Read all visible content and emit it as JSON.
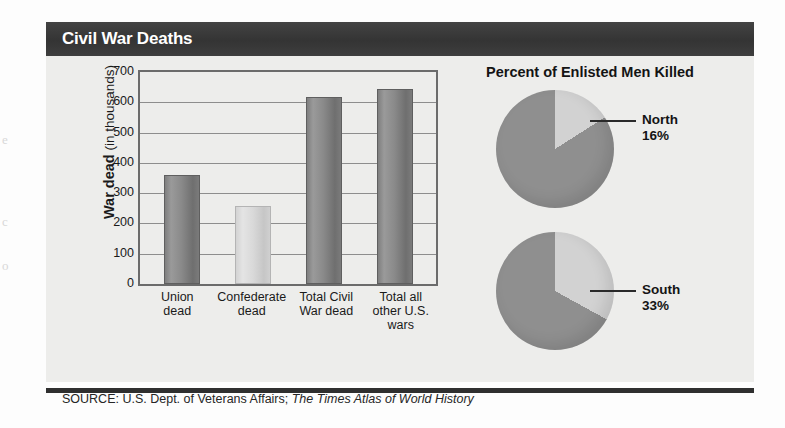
{
  "header": {
    "title": "Civil War Deaths",
    "bar_color": "#3a3a3a",
    "title_color": "#ffffff"
  },
  "panel": {
    "background": "#ededeb"
  },
  "source": {
    "prefix": "SOURCE: U.S. Dept. of Veterans Affairs; ",
    "italic": "The Times Atlas of World History"
  },
  "bleed_through": {
    "m1": "e",
    "m2": "c",
    "m3": "o"
  },
  "chart_data": [
    {
      "type": "bar",
      "title": "Civil War Deaths",
      "xlabel": "",
      "ylabel": "War dead (in thousands)",
      "ylabel_bold": "War dead",
      "ylabel_rest": " (in thousands)",
      "categories": [
        "Union dead",
        "Confederate dead",
        "Total Civil War dead",
        "Total all other U.S. wars"
      ],
      "category_lines": [
        [
          "Union",
          "dead"
        ],
        [
          "Confederate",
          "dead"
        ],
        [
          "Total Civil",
          "War dead"
        ],
        [
          "Total all",
          "other U.S.",
          "wars"
        ]
      ],
      "values": [
        360,
        258,
        618,
        643
      ],
      "bar_colors": [
        "#8a8a8a",
        "#d9d9d9",
        "#8a8a8a",
        "#8a8a8a"
      ],
      "ylim": [
        0,
        700
      ],
      "yticks": [
        700,
        600,
        500,
        400,
        300,
        200,
        100,
        0
      ],
      "grid": true,
      "units": "thousands"
    },
    {
      "type": "pie",
      "title": "Percent of Enlisted Men Killed",
      "charts": [
        {
          "name": "North",
          "label": "North",
          "percent_label": "16%",
          "values": [
            16,
            84
          ],
          "slice_names": [
            "killed",
            "survived"
          ],
          "slice_colors": [
            "#d2d2d2",
            "#8f8f8f"
          ]
        },
        {
          "name": "South",
          "label": "South",
          "percent_label": "33%",
          "values": [
            33,
            67
          ],
          "slice_names": [
            "killed",
            "survived"
          ],
          "slice_colors": [
            "#d2d2d2",
            "#8f8f8f"
          ]
        }
      ]
    }
  ]
}
